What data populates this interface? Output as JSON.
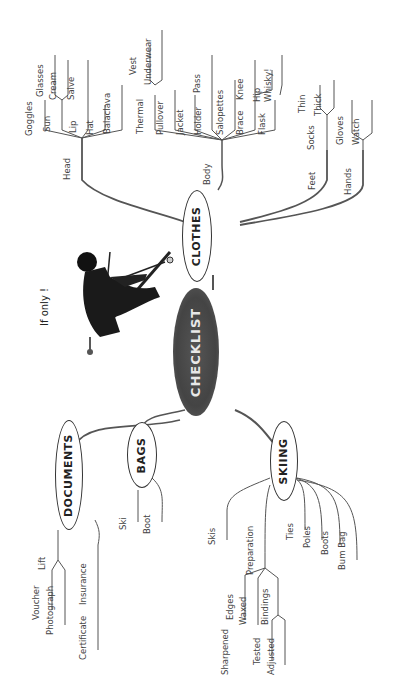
{
  "root": {
    "label": "CHECKLIST",
    "color": "#4a4a4a"
  },
  "caption": "If only !",
  "branches": {
    "clothes": {
      "label": "CLOTHES",
      "head": {
        "label": "Head",
        "items": [
          "Goggles",
          "Sun",
          "Glasses",
          "Cream",
          "Lip",
          "Salve",
          "Hat",
          "Balaclava"
        ]
      },
      "body": {
        "label": "Body",
        "items": [
          "Thermal",
          "Vest",
          "Underwear",
          "Pullover",
          "Jacket",
          "Holder",
          "Pass",
          "Salopettes",
          "Brace",
          "Knee",
          "Hip",
          "Flask",
          "Whisky!"
        ]
      },
      "feet": {
        "label": "Feet",
        "items": [
          "Socks",
          "Thin",
          "Thick"
        ]
      },
      "hands": {
        "label": "Hands",
        "items": [
          "Gloves",
          "Watch"
        ]
      }
    },
    "documents": {
      "label": "DOCUMENTS",
      "items": [
        "Lift",
        "Voucher",
        "Photograph",
        "Insurance",
        "Certificate"
      ]
    },
    "bags": {
      "label": "BAGS",
      "items": [
        "Ski",
        "Boot"
      ]
    },
    "skiing": {
      "label": "SKIING",
      "items": [
        "Skis",
        "Preparation",
        "Edges",
        "Sharpened",
        "Waxed",
        "Bindings",
        "Tested",
        "Adjusted",
        "Ties",
        "Poles",
        "Boots",
        "Bum Bag"
      ]
    }
  }
}
